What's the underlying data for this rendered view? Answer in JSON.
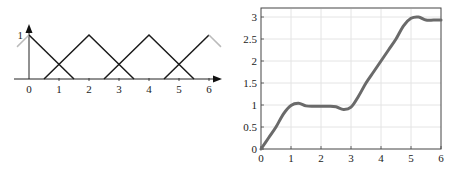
{
  "chart_data": [
    {
      "type": "line",
      "title": "",
      "description": "Triangular membership functions",
      "xlabel": "",
      "ylabel": "",
      "x_ticks": [
        "0",
        "1",
        "2",
        "3",
        "4",
        "5",
        "6"
      ],
      "y_ticks": [
        "1"
      ],
      "xlim": [
        -0.4,
        6.45
      ],
      "ylim": [
        0,
        1
      ],
      "grid": false,
      "series": [
        {
          "name": "mf1",
          "x": [
            -0.4,
            0,
            1.5
          ],
          "y": [
            0.73,
            1,
            0
          ],
          "note": "left part gray (beyond domain)"
        },
        {
          "name": "mf2",
          "x": [
            0.5,
            2,
            3.5
          ],
          "y": [
            0,
            1,
            0
          ]
        },
        {
          "name": "mf3",
          "x": [
            2.5,
            4,
            5.5
          ],
          "y": [
            0,
            1,
            0
          ]
        },
        {
          "name": "mf4",
          "x": [
            4.5,
            6,
            6.4
          ],
          "y": [
            0,
            1,
            0.73
          ],
          "note": "right part gray (beyond domain)"
        }
      ]
    },
    {
      "type": "line",
      "title": "",
      "xlabel": "",
      "ylabel": "",
      "x_ticks": [
        "0",
        "1",
        "2",
        "3",
        "4",
        "5",
        "6"
      ],
      "y_ticks": [
        "0",
        "0.5",
        "1",
        "1.5",
        "2",
        "2.5",
        "3"
      ],
      "xlim": [
        0,
        6
      ],
      "ylim": [
        0,
        3.2
      ],
      "grid": true,
      "series": [
        {
          "name": "output",
          "x": [
            0,
            0.25,
            0.5,
            0.75,
            1.0,
            1.25,
            1.5,
            1.75,
            2.0,
            2.25,
            2.5,
            2.75,
            3.0,
            3.25,
            3.5,
            3.75,
            4.0,
            4.25,
            4.5,
            4.75,
            5.0,
            5.25,
            5.5,
            5.75,
            6.0
          ],
          "y": [
            0,
            0.25,
            0.5,
            0.8,
            0.99,
            1.04,
            0.98,
            0.97,
            0.97,
            0.97,
            0.96,
            0.9,
            0.95,
            1.2,
            1.5,
            1.75,
            2.0,
            2.25,
            2.5,
            2.8,
            2.97,
            3.0,
            2.93,
            2.93,
            2.93
          ]
        }
      ]
    }
  ]
}
